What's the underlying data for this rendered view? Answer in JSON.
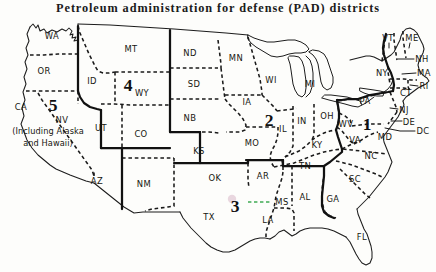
{
  "figure": {
    "title": "Petroleum administration for defense (PAD) districts",
    "background_color": "#fdfdfb",
    "ink_color": "#1a1a1a",
    "annotation_color": "#3faa54"
  },
  "legend_semantics": {
    "district_boundary_style": "solid thick line",
    "state_boundary_style": "dashed line",
    "coastline_style": "thin solid line"
  },
  "districts": [
    {
      "id": "1",
      "label": "1",
      "x": 367,
      "y": 124
    },
    {
      "id": "2",
      "label": "2",
      "x": 269,
      "y": 120
    },
    {
      "id": "3",
      "label": "3",
      "x": 235,
      "y": 206
    },
    {
      "id": "4",
      "label": "4",
      "x": 128,
      "y": 85
    },
    {
      "id": "5",
      "label": "5",
      "x": 53,
      "y": 105
    }
  ],
  "notes": [
    {
      "id": "alaska-hawaii-note",
      "line1": "(Including Alaska",
      "line2": "and Hawaii)",
      "x": 48,
      "y": 136
    }
  ],
  "states": [
    {
      "abbr": "WA",
      "x": 52,
      "y": 36
    },
    {
      "abbr": "OR",
      "x": 44,
      "y": 71
    },
    {
      "abbr": "CA",
      "x": 21,
      "y": 107
    },
    {
      "abbr": "NV",
      "x": 62,
      "y": 120
    },
    {
      "abbr": "ID",
      "x": 92,
      "y": 81
    },
    {
      "abbr": "MT",
      "x": 131,
      "y": 49
    },
    {
      "abbr": "WY",
      "x": 142,
      "y": 93
    },
    {
      "abbr": "UT",
      "x": 101,
      "y": 128
    },
    {
      "abbr": "CO",
      "x": 141,
      "y": 134
    },
    {
      "abbr": "AZ",
      "x": 97,
      "y": 181
    },
    {
      "abbr": "NM",
      "x": 144,
      "y": 184
    },
    {
      "abbr": "ND",
      "x": 190,
      "y": 53
    },
    {
      "abbr": "SD",
      "x": 194,
      "y": 84
    },
    {
      "abbr": "NB",
      "x": 190,
      "y": 118
    },
    {
      "abbr": "KS",
      "x": 199,
      "y": 151
    },
    {
      "abbr": "OK",
      "x": 215,
      "y": 178
    },
    {
      "abbr": "TX",
      "x": 209,
      "y": 217
    },
    {
      "abbr": "MN",
      "x": 236,
      "y": 58
    },
    {
      "abbr": "IA",
      "x": 247,
      "y": 102
    },
    {
      "abbr": "MO",
      "x": 252,
      "y": 143
    },
    {
      "abbr": "AR",
      "x": 263,
      "y": 176
    },
    {
      "abbr": "LA",
      "x": 268,
      "y": 220
    },
    {
      "abbr": "WI",
      "x": 271,
      "y": 80
    },
    {
      "abbr": "IL",
      "x": 283,
      "y": 129
    },
    {
      "abbr": "MI",
      "x": 310,
      "y": 84
    },
    {
      "abbr": "IN",
      "x": 302,
      "y": 121
    },
    {
      "abbr": "OH",
      "x": 327,
      "y": 116
    },
    {
      "abbr": "KY",
      "x": 317,
      "y": 145
    },
    {
      "abbr": "TN",
      "x": 305,
      "y": 166
    },
    {
      "abbr": "MS",
      "x": 282,
      "y": 202
    },
    {
      "abbr": "AL",
      "x": 305,
      "y": 197
    },
    {
      "abbr": "GA",
      "x": 333,
      "y": 199
    },
    {
      "abbr": "FL",
      "x": 362,
      "y": 237
    },
    {
      "abbr": "SC",
      "x": 355,
      "y": 179
    },
    {
      "abbr": "NC",
      "x": 371,
      "y": 156
    },
    {
      "abbr": "VA",
      "x": 355,
      "y": 140
    },
    {
      "abbr": "WV",
      "x": 346,
      "y": 124
    },
    {
      "abbr": "PA",
      "x": 365,
      "y": 101
    },
    {
      "abbr": "NY",
      "x": 382,
      "y": 73
    },
    {
      "abbr": "VT",
      "x": 388,
      "y": 38
    },
    {
      "abbr": "ME",
      "x": 412,
      "y": 38
    },
    {
      "abbr": "NH",
      "x": 422,
      "y": 59
    },
    {
      "abbr": "MA",
      "x": 424,
      "y": 73
    },
    {
      "abbr": "RI",
      "x": 424,
      "y": 86
    },
    {
      "abbr": "CT",
      "x": 406,
      "y": 93
    },
    {
      "abbr": "NJ",
      "x": 404,
      "y": 110
    },
    {
      "abbr": "DE",
      "x": 409,
      "y": 122
    },
    {
      "abbr": "DC",
      "x": 423,
      "y": 131
    },
    {
      "abbr": "MD",
      "x": 385,
      "y": 137
    }
  ]
}
